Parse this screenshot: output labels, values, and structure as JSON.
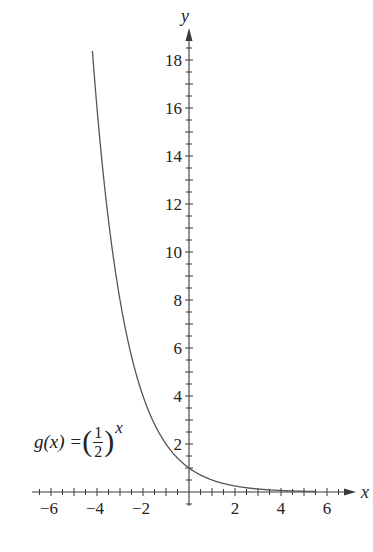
{
  "chart_data": {
    "type": "line",
    "title": "",
    "function_label": {
      "prefix": "g(x) = ",
      "base_numerator": "1",
      "base_denominator": "2",
      "exponent": "x"
    },
    "xlabel": "x",
    "ylabel": "y",
    "xlim": [
      -6.8,
      7.2
    ],
    "ylim": [
      -0.6,
      19.3
    ],
    "x_ticks_labeled": [
      -6,
      -4,
      -2,
      2,
      4,
      6
    ],
    "x_minor_tick_step": 0.5,
    "y_ticks_labeled": [
      2,
      4,
      6,
      8,
      10,
      12,
      14,
      16,
      18
    ],
    "y_minor_tick_step": 0.5,
    "grid": false,
    "series": [
      {
        "name": "g(x) = (1/2)^x",
        "formula": "(1/2)^x",
        "x_range": [
          -4.2,
          5.5
        ],
        "x": [
          -4.2,
          -4,
          -3,
          -2,
          -1,
          0,
          1,
          2,
          3,
          4,
          5,
          5.5
        ],
        "y": [
          18.38,
          16,
          8,
          4,
          2,
          1,
          0.5,
          0.25,
          0.125,
          0.0625,
          0.03125,
          0.022
        ],
        "color": "#555555"
      }
    ]
  },
  "axes_labels": {
    "x": "x",
    "y": "y"
  },
  "colors": {
    "axis": "#3a3a3a",
    "curve": "#555555",
    "background": "#ffffff"
  }
}
